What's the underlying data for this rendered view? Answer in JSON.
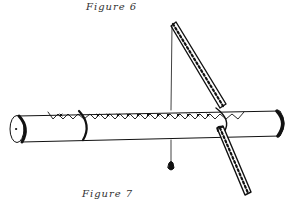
{
  "figures": {
    "top_caption": "Figure 6",
    "bottom_caption": "Figure 7"
  },
  "illustration": {
    "subject": "tube with zigzag strip, ladder-like measuring stick and plumb line",
    "colors": {
      "ink": "#111111",
      "paper": "#ffffff",
      "caption": "#333333"
    }
  }
}
